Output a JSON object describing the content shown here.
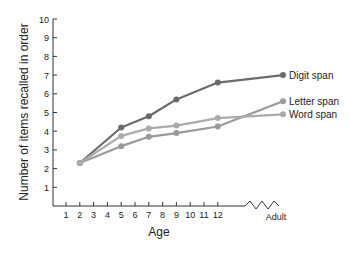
{
  "chart_data": {
    "type": "line",
    "title": "",
    "xlabel": "Age",
    "ylabel": "Number of items recalled in order",
    "ylim": [
      0,
      10
    ],
    "yticks": [
      1,
      2,
      3,
      4,
      5,
      6,
      7,
      8,
      9,
      10
    ],
    "xticks": [
      "1",
      "2",
      "3",
      "4",
      "5",
      "6",
      "7",
      "8",
      "9",
      "10",
      "11",
      "12",
      "Adult"
    ],
    "axis_break": "between 12 and Adult",
    "grid": false,
    "legend_position": "inline labels at right end of lines",
    "x": [
      "2",
      "5",
      "7",
      "9",
      "12",
      "Adult"
    ],
    "series": [
      {
        "name": "Digit span",
        "color": "#6b6b6b",
        "values": [
          2.3,
          4.2,
          4.8,
          5.7,
          6.6,
          7.0
        ]
      },
      {
        "name": "Letter span",
        "color": "#9a9a9a",
        "values": [
          2.3,
          3.2,
          3.7,
          3.9,
          4.25,
          5.6
        ]
      },
      {
        "name": "Word span",
        "color": "#ababab",
        "values": [
          2.3,
          3.75,
          4.15,
          4.3,
          4.7,
          4.9
        ]
      }
    ]
  }
}
